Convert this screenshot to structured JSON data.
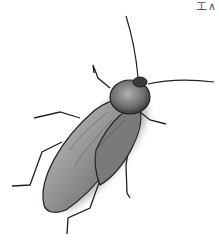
{
  "image": {
    "subject": "cockroach illustration",
    "corner_text": "エ∧"
  },
  "colors": {
    "background": "#ffffff",
    "body_dark": "#4a4a4a",
    "body_mid": "#8a8a8a",
    "body_light": "#c8c8c8",
    "outline": "#222222"
  }
}
